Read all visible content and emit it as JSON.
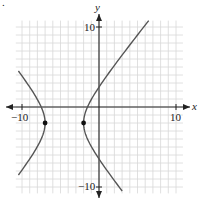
{
  "chart_data": {
    "type": "line",
    "title": "",
    "xlabel": "x",
    "ylabel": "y",
    "xlim": [
      -10.8,
      10.9
    ],
    "ylim": [
      -10.8,
      10.8
    ],
    "grid": true,
    "grid_step": 1,
    "x_tick_labels": [
      "-10",
      "10"
    ],
    "y_tick_labels": [
      "10",
      "-10"
    ],
    "curve": {
      "kind": "hyperbola",
      "equation": "(x+4.5)^2/6.25 - (y+2)^2/9 = 1",
      "center": [
        -4.5,
        -2
      ],
      "a": 2.5,
      "b": 3,
      "orientation": "horizontal"
    },
    "points": [
      {
        "label": "vertex-left",
        "x": -7,
        "y": -2
      },
      {
        "label": "vertex-right",
        "x": -2,
        "y": -2
      }
    ],
    "branch_endpoints": {
      "left_upper": [
        -10.5,
        4.5
      ],
      "left_lower": [
        -10.5,
        -8.5
      ],
      "right_upper": [
        5.5,
        10.8
      ],
      "right_lower": [
        3,
        -10.5
      ]
    }
  },
  "labels": {
    "x_axis": "x",
    "y_axis": "y",
    "x_min": "−10",
    "x_max": "10",
    "y_max": "10",
    "y_min": "−10",
    "corner_mark": "."
  },
  "colors": {
    "grid": "#d8d8d8",
    "axis": "#222222",
    "curve": "#555555",
    "point": "#111111"
  }
}
